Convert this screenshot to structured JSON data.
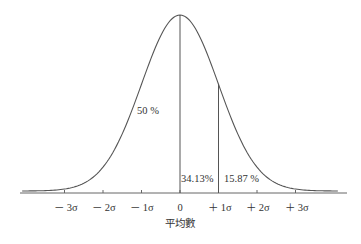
{
  "chart_data": {
    "type": "line",
    "title": "",
    "xlabel": "平均數",
    "ylabel": "",
    "x_ticks": [
      "－3σ",
      "－2σ",
      "－1σ",
      "0",
      "＋1σ",
      "＋2σ",
      "＋3σ"
    ],
    "x_tick_values": [
      -3,
      -2,
      -1,
      0,
      1,
      2,
      3
    ],
    "xlim": [
      -4.1,
      4.1
    ],
    "grid": false,
    "legend": null,
    "annotations": [
      {
        "text": "50 %",
        "region": "left half under curve"
      },
      {
        "text": "34.13%",
        "region": "between 0 and +1σ"
      },
      {
        "text": "15.87 %",
        "region": "beyond +1σ"
      }
    ],
    "vertical_lines": [
      0,
      1
    ],
    "series": [
      {
        "name": "normal density",
        "function": "exp(-x^2/2)/sqrt(2π)"
      }
    ]
  },
  "labels": {
    "ticks": [
      "－ 3σ",
      "－ 2σ",
      "－ 1σ",
      "0",
      "＋ 1σ",
      "＋ 2σ",
      "＋ 3σ"
    ],
    "xlabel": "平均數",
    "pct_left": "50 %",
    "pct_mid": "34.13%",
    "pct_right": "15.87 %"
  },
  "colors": {
    "line": "#555555",
    "text": "#333333",
    "background": "#ffffff"
  }
}
